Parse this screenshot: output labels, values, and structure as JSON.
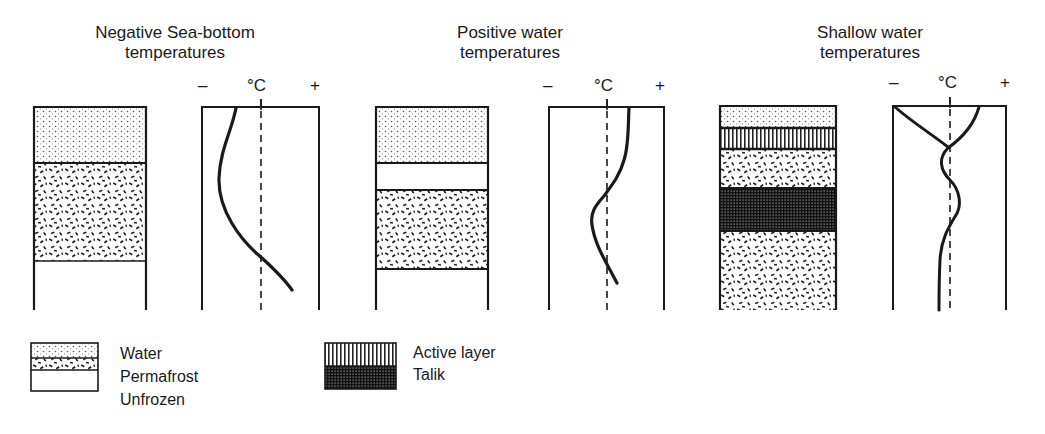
{
  "panels": [
    {
      "title_line1": "Negative Sea-bottom",
      "title_line2": "temperatures",
      "axis": {
        "minus": "–",
        "unit": "°C",
        "plus": "+"
      },
      "strata": [
        {
          "type": "water",
          "top": 107,
          "bottom": 163
        },
        {
          "type": "permafrost",
          "top": 163,
          "bottom": 261
        },
        {
          "type": "unfrozen",
          "top": 261,
          "bottom": 310
        }
      ],
      "temperature_profile": "starts slightly negative at sea-bottom, bows further negative in permafrost, crosses 0°C near base of permafrost and becomes positive in unfrozen ground"
    },
    {
      "title_line1": "Positive water",
      "title_line2": "temperatures",
      "axis": {
        "minus": "–",
        "unit": "°C",
        "plus": "+"
      },
      "strata": [
        {
          "type": "water",
          "top": 107,
          "bottom": 163
        },
        {
          "type": "unfrozen",
          "top": 163,
          "bottom": 190
        },
        {
          "type": "permafrost",
          "top": 190,
          "bottom": 269
        },
        {
          "type": "unfrozen",
          "top": 269,
          "bottom": 310
        }
      ],
      "temperature_profile": "positive at sea-bottom, crosses to negative within permafrost, returns toward positive below"
    },
    {
      "title_line1": "Shallow water",
      "title_line2": "temperatures",
      "axis": {
        "minus": "–",
        "unit": "°C",
        "plus": "+"
      },
      "strata": [
        {
          "type": "water",
          "top": 106,
          "bottom": 128
        },
        {
          "type": "active_layer",
          "top": 128,
          "bottom": 149
        },
        {
          "type": "permafrost",
          "top": 149,
          "bottom": 188
        },
        {
          "type": "talik",
          "top": 188,
          "bottom": 231
        },
        {
          "type": "permafrost",
          "top": 231,
          "bottom": 310
        }
      ],
      "temperature_profile": "seasonal envelope (negative and positive) in active layer converging near 0°C, oscillating around 0°C through permafrost and talik, slightly negative at depth"
    }
  ],
  "legend": {
    "items": [
      {
        "key": "water",
        "label": "Water"
      },
      {
        "key": "permafrost",
        "label": "Permafrost"
      },
      {
        "key": "unfrozen",
        "label": "Unfrozen"
      },
      {
        "key": "active_layer",
        "label": "Active layer"
      },
      {
        "key": "talik",
        "label": "Talik"
      }
    ]
  },
  "colors": {
    "ink": "#1a1a1a",
    "background": "#ffffff"
  }
}
